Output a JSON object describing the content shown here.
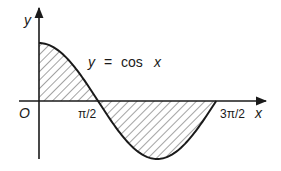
{
  "figure": {
    "equation_label": "y  =  cos  x",
    "equation_parts": {
      "lhs": "y",
      "eq": "=",
      "fn": "cos",
      "arg": "x"
    },
    "axes": {
      "x_label": "x",
      "y_label": "y",
      "origin_label": "O"
    },
    "ticks": {
      "pi_over_2": "π/2",
      "three_pi_over_2": "3π/2"
    },
    "regions": [
      {
        "name": "positive-region",
        "from": "0",
        "to": "π/2",
        "sign": "above axis"
      },
      {
        "name": "negative-region",
        "from": "π/2",
        "to": "3π/2",
        "sign": "below axis"
      }
    ],
    "colors": {
      "ink": "#1a1a1a",
      "hatch": "#333333",
      "background": "#ffffff"
    }
  }
}
